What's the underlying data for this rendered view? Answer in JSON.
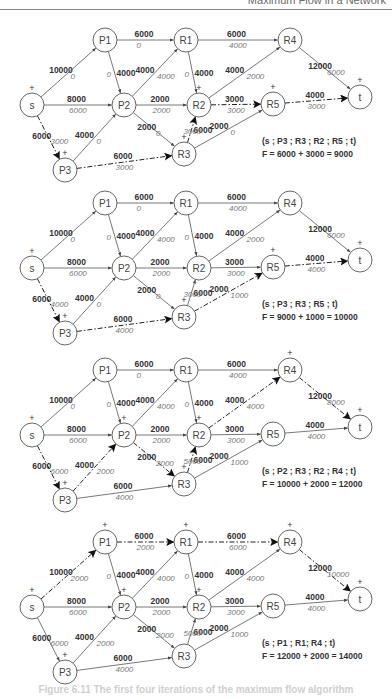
{
  "header": {
    "title": "Maximum Flow in a Network"
  },
  "caption": "Figure 6.11  The first four iterations of the maximum flow algorithm",
  "node_positions": {
    "s": [
      32,
      0
    ],
    "P1": [
      105,
      -65
    ],
    "R1": [
      186,
      -65
    ],
    "R4": [
      290,
      -65
    ],
    "t": [
      360,
      -8
    ],
    "P2": [
      124,
      0
    ],
    "R2": [
      199,
      0
    ],
    "R5": [
      273,
      -1
    ],
    "P3": [
      65,
      65
    ],
    "R3": [
      184,
      49
    ]
  },
  "edges": [
    {
      "id": "s-P1",
      "from": "s",
      "to": "P1",
      "capacity": 10000
    },
    {
      "id": "s-P2",
      "from": "s",
      "to": "P2",
      "capacity": 8000
    },
    {
      "id": "s-P3",
      "from": "s",
      "to": "P3",
      "capacity": 6000
    },
    {
      "id": "P1-R1",
      "from": "P1",
      "to": "R1",
      "capacity": 6000
    },
    {
      "id": "P1-P2",
      "from": "P1",
      "to": "P2",
      "capacity": 4000
    },
    {
      "id": "P2-R1",
      "from": "P2",
      "to": "R1",
      "capacity": 4000
    },
    {
      "id": "P2-R2",
      "from": "P2",
      "to": "R2",
      "capacity": 2000
    },
    {
      "id": "P2-R3",
      "from": "P2",
      "to": "R3",
      "capacity": 2000
    },
    {
      "id": "P3-P2",
      "from": "P3",
      "to": "P2",
      "capacity": 4000
    },
    {
      "id": "P3-R3",
      "from": "P3",
      "to": "R3",
      "capacity": 6000
    },
    {
      "id": "R1-R4",
      "from": "R1",
      "to": "R4",
      "capacity": 6000
    },
    {
      "id": "R1-R2",
      "from": "R1",
      "to": "R2",
      "capacity": 4000
    },
    {
      "id": "R3-R2",
      "from": "R3",
      "to": "R2",
      "capacity": 6000
    },
    {
      "id": "R2-R4",
      "from": "R2",
      "to": "R4",
      "capacity": 4000
    },
    {
      "id": "R2-R5",
      "from": "R2",
      "to": "R5",
      "capacity": 3000
    },
    {
      "id": "R3-R5",
      "from": "R3",
      "to": "R5",
      "capacity": 2000
    },
    {
      "id": "R4-t",
      "from": "R4",
      "to": "t",
      "capacity": 12000
    },
    {
      "id": "R5-t",
      "from": "R5",
      "to": "t",
      "capacity": 4000
    }
  ],
  "iterations": [
    {
      "base_y": 105,
      "path_label": "(s ; P3 ; R3 ; R2 ; R5 ; t)",
      "flow_label": "F = 6000 + 3000 = 9000",
      "augmenting_edges": [
        "s-P3",
        "P3-R3",
        "R3-R2",
        "R2-R5",
        "R5-t"
      ],
      "plus_nodes": [
        "s",
        "P3",
        "R3",
        "R2",
        "R5",
        "t"
      ],
      "flows": {
        "s-P1": 0,
        "s-P2": 6000,
        "s-P3": 3000,
        "P1-R1": 0,
        "P1-P2": 0,
        "P2-R1": 4000,
        "P2-R2": 2000,
        "P2-R3": 0,
        "P3-P2": 0,
        "P3-R3": 3000,
        "R1-R4": 4000,
        "R1-R2": 0,
        "R3-R2": 3000,
        "R2-R4": 2000,
        "R2-R5": 3000,
        "R3-R5": 0,
        "R4-t": 6000,
        "R5-t": 3000
      }
    },
    {
      "base_y": 268,
      "path_label": "(s ; P3 ; R3 ; R5 ; t)",
      "flow_label": "F = 9000 + 1000 = 10000",
      "augmenting_edges": [
        "s-P3",
        "P3-R3",
        "R3-R5",
        "R5-t"
      ],
      "plus_nodes": [
        "s",
        "P3",
        "R3",
        "R5",
        "t"
      ],
      "flows": {
        "s-P1": 0,
        "s-P2": 6000,
        "s-P3": 4000,
        "P1-R1": 0,
        "P1-P2": 0,
        "P2-R1": 4000,
        "P2-R2": 2000,
        "P2-R3": 0,
        "P3-P2": 0,
        "P3-R3": 4000,
        "R1-R4": 4000,
        "R1-R2": 0,
        "R3-R2": 3000,
        "R2-R4": 2000,
        "R2-R5": 3000,
        "R3-R5": 1000,
        "R4-t": 6000,
        "R5-t": 4000
      }
    },
    {
      "base_y": 435,
      "path_label": "(s ; P2 ; R3 ; R2 ; R4 ; t)",
      "flow_label": "F = 10000 + 2000 = 12000",
      "augmenting_edges": [
        "s-P3",
        "P3-P2",
        "P2-R3",
        "R3-R2",
        "R2-R4",
        "R4-t"
      ],
      "plus_nodes": [
        "s",
        "P3",
        "P2",
        "R3",
        "R2",
        "R4",
        "t"
      ],
      "flows": {
        "s-P1": 0,
        "s-P2": 6000,
        "s-P3": 6000,
        "P1-R1": 0,
        "P1-P2": 0,
        "P2-R1": 4000,
        "P2-R2": 2000,
        "P2-R3": 2000,
        "P3-P2": 2000,
        "P3-R3": 4000,
        "R1-R4": 4000,
        "R1-R2": 0,
        "R3-R2": 5000,
        "R2-R4": 4000,
        "R2-R5": 3000,
        "R3-R5": 1000,
        "R4-t": 8000,
        "R5-t": 4000
      }
    },
    {
      "base_y": 607,
      "path_label": "(s ; P1 ; R1; R4 ; t)",
      "flow_label": "F = 12000 + 2000 = 14000",
      "augmenting_edges": [
        "s-P1",
        "P1-R1",
        "R1-R4",
        "R4-t"
      ],
      "plus_nodes": [
        "s",
        "P1",
        "R1",
        "R4",
        "P2",
        "R2",
        "P3",
        "t"
      ],
      "flows": {
        "s-P1": 2000,
        "s-P2": 6000,
        "s-P3": 6000,
        "P1-R1": 2000,
        "P1-P2": 0,
        "P2-R1": 4000,
        "P2-R2": 2000,
        "P2-R3": 2000,
        "P3-P2": 2000,
        "P3-R3": 4000,
        "R1-R4": 6000,
        "R1-R2": 0,
        "R3-R2": 5000,
        "R2-R4": 4000,
        "R2-R5": 3000,
        "R3-R5": 1000,
        "R4-t": 10000,
        "R5-t": 4000
      }
    }
  ]
}
